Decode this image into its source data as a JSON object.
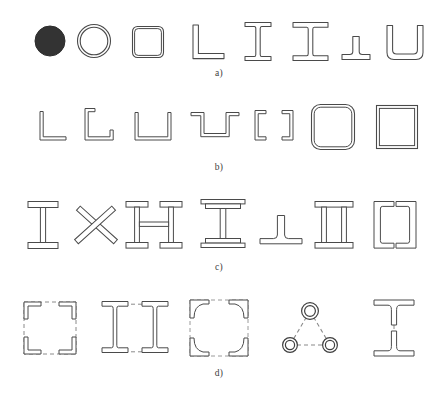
{
  "figure": {
    "background_color": "#ffffff",
    "line_color": "#4a4a4a",
    "fill_color": "#ffffff",
    "solid_fill_color": "#333333",
    "dashed_color": "#8a8a8a"
  },
  "rows": [
    {
      "id": "row-a",
      "label": "a)",
      "caption": "Hot-rolled sections",
      "shapes": [
        {
          "name": "solid-round-bar",
          "label": "solid round bar"
        },
        {
          "name": "circular-hollow-section",
          "label": "circular hollow section"
        },
        {
          "name": "square-hollow-section",
          "label": "square hollow section"
        },
        {
          "name": "angle-section",
          "label": "angle section"
        },
        {
          "name": "i-beam-section",
          "label": "I beam"
        },
        {
          "name": "h-beam-section",
          "label": "H beam"
        },
        {
          "name": "t-section",
          "label": "T section"
        },
        {
          "name": "channel-section",
          "label": "channel section"
        }
      ]
    },
    {
      "id": "row-b",
      "label": "b)",
      "caption": "Cold-formed thin-walled sections",
      "shapes": [
        {
          "name": "cold-formed-angle",
          "label": "angle"
        },
        {
          "name": "cold-formed-lipped-angle",
          "label": "lipped angle"
        },
        {
          "name": "cold-formed-channel",
          "label": "channel"
        },
        {
          "name": "cold-formed-hat-section",
          "label": "hat section"
        },
        {
          "name": "cold-formed-lipped-channel",
          "label": "lipped channel"
        },
        {
          "name": "cold-formed-rounded-rhs",
          "label": "rounded rectangular hollow section"
        },
        {
          "name": "cold-formed-square-rhs",
          "label": "square hollow section"
        }
      ]
    },
    {
      "id": "row-c",
      "label": "c)",
      "caption": "Welded built-up sections",
      "shapes": [
        {
          "name": "welded-i-section",
          "label": "welded I section"
        },
        {
          "name": "welded-cross-section",
          "label": "cruciform section"
        },
        {
          "name": "welded-double-i-battened",
          "label": "battened double I section"
        },
        {
          "name": "welded-plated-i-section",
          "label": "plated I section"
        },
        {
          "name": "welded-t-section",
          "label": "welded T section"
        },
        {
          "name": "welded-box-section",
          "label": "welded box section"
        },
        {
          "name": "welded-double-channel",
          "label": "back-to-back channels"
        }
      ]
    },
    {
      "id": "row-d",
      "label": "d)",
      "caption": "Laced and battened compound sections",
      "shapes": [
        {
          "name": "laced-four-angle-box",
          "label": "four angles laced into a box"
        },
        {
          "name": "battened-double-i",
          "label": "two I sections battened"
        },
        {
          "name": "laced-four-angle-square",
          "label": "four angles laced, square outline"
        },
        {
          "name": "laced-three-tube-triangle",
          "label": "three tubes laced in a triangle"
        },
        {
          "name": "battened-double-t",
          "label": "two T sections battened"
        }
      ]
    }
  ]
}
